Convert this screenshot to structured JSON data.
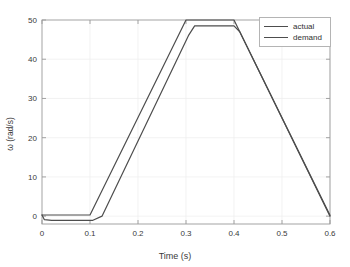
{
  "chart_data": {
    "type": "line",
    "title": "",
    "xlabel": "Time (s)",
    "ylabel": "ω (rad/s)",
    "xlim": [
      0,
      0.6
    ],
    "ylim": [
      -2,
      50
    ],
    "xticks": [
      "0",
      "0.1",
      "0.2",
      "0.3",
      "0.4",
      "0.5",
      "0.6"
    ],
    "xtick_values": [
      0,
      0.1,
      0.2,
      0.3,
      0.4,
      0.5,
      0.6
    ],
    "yticks": [
      "0",
      "10",
      "20",
      "30",
      "40",
      "50"
    ],
    "ytick_values": [
      0,
      10,
      20,
      30,
      40,
      50
    ],
    "grid": true,
    "legend_position": "top-right",
    "series": [
      {
        "name": "actual",
        "color": "#4d4d4d",
        "x": [
          0,
          0.005,
          0.02,
          0.095,
          0.105,
          0.125,
          0.305,
          0.318,
          0.4,
          0.412,
          0.6
        ],
        "y": [
          0.3,
          -0.9,
          -1.1,
          -1.1,
          -1.1,
          0.0,
          46.0,
          48.5,
          48.5,
          47.0,
          0.2
        ]
      },
      {
        "name": "demand",
        "color": "#4d4d4d",
        "x": [
          0,
          0.1,
          0.3,
          0.4,
          0.6
        ],
        "y": [
          0.3,
          0.3,
          50.0,
          50.0,
          0.0
        ]
      }
    ]
  },
  "legend": {
    "items": [
      {
        "label": "actual"
      },
      {
        "label": "demand"
      }
    ]
  },
  "colors": {
    "line": "#4d4d4d",
    "axis": "#9a9a9a",
    "grid": "#ececec",
    "text": "#3a3a3a",
    "background": "#ffffff"
  }
}
